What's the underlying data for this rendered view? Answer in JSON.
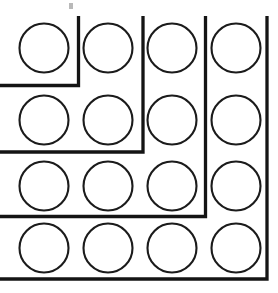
{
  "figure": {
    "background_color": "#ffffff",
    "stroke_color": "#141414",
    "circle_stroke_color": "#1b1b1b",
    "circle_fill": "none",
    "canvas": {
      "width": 278,
      "height": 293
    },
    "grid": {
      "rows": 4,
      "columns": 4,
      "total_circles": 16
    }
  },
  "circles": [
    {
      "label": "circle-r1-c1",
      "cx": 44,
      "cy": 48,
      "r": 24.5,
      "row": 1,
      "column": 1
    },
    {
      "label": "circle-r1-c2",
      "cx": 108,
      "cy": 48,
      "r": 24.5,
      "row": 1,
      "column": 2
    },
    {
      "label": "circle-r1-c3",
      "cx": 172,
      "cy": 48,
      "r": 24.5,
      "row": 1,
      "column": 3
    },
    {
      "label": "circle-r1-c4",
      "cx": 236,
      "cy": 48,
      "r": 24.5,
      "row": 1,
      "column": 4
    },
    {
      "label": "circle-r2-c1",
      "cx": 44,
      "cy": 120,
      "r": 24.5,
      "row": 2,
      "column": 1
    },
    {
      "label": "circle-r2-c2",
      "cx": 108,
      "cy": 120,
      "r": 24.5,
      "row": 2,
      "column": 2
    },
    {
      "label": "circle-r2-c3",
      "cx": 172,
      "cy": 120,
      "r": 24.5,
      "row": 2,
      "column": 3
    },
    {
      "label": "circle-r2-c4",
      "cx": 236,
      "cy": 120,
      "r": 24.5,
      "row": 2,
      "column": 4
    },
    {
      "label": "circle-r3-c1",
      "cx": 44,
      "cy": 186,
      "r": 24.5,
      "row": 3,
      "column": 1
    },
    {
      "label": "circle-r3-c2",
      "cx": 108,
      "cy": 186,
      "r": 24.5,
      "row": 3,
      "column": 2
    },
    {
      "label": "circle-r3-c3",
      "cx": 172,
      "cy": 186,
      "r": 24.5,
      "row": 3,
      "column": 3
    },
    {
      "label": "circle-r3-c4",
      "cx": 236,
      "cy": 186,
      "r": 24.5,
      "row": 3,
      "column": 4
    },
    {
      "label": "circle-r4-c1",
      "cx": 44,
      "cy": 248,
      "r": 24.5,
      "row": 4,
      "column": 1
    },
    {
      "label": "circle-r4-c2",
      "cx": 108,
      "cy": 248,
      "r": 24.5,
      "row": 4,
      "column": 2
    },
    {
      "label": "circle-r4-c3",
      "cx": 172,
      "cy": 248,
      "r": 24.5,
      "row": 4,
      "column": 3
    },
    {
      "label": "circle-r4-c4",
      "cx": 236,
      "cy": 248,
      "r": 24.5,
      "row": 4,
      "column": 4
    }
  ],
  "gnomons": [
    {
      "label": "gnomon-1",
      "path": "M 78.5 16 L 78.5 85.5 L 0 85.5",
      "corner_x": 78.5,
      "corner_y": 85.5,
      "encloses_circles": 1
    },
    {
      "label": "gnomon-2",
      "path": "M 143 16 L 143 152 L 0 152",
      "corner_x": 143,
      "corner_y": 152,
      "encloses_circles": 4
    },
    {
      "label": "gnomon-3",
      "path": "M 205.5 16 L 205.5 216.5 L 0 216.5",
      "corner_x": 205.5,
      "corner_y": 216.5,
      "encloses_circles": 9
    },
    {
      "label": "gnomon-4",
      "path": "M 267 16 L 267 279 L 0 279",
      "corner_x": 267,
      "corner_y": 279,
      "encloses_circles": 16
    }
  ],
  "artifacts": [
    {
      "label": "scan-speck",
      "x": 69,
      "y": 3,
      "width": 4,
      "height": 6
    }
  ]
}
